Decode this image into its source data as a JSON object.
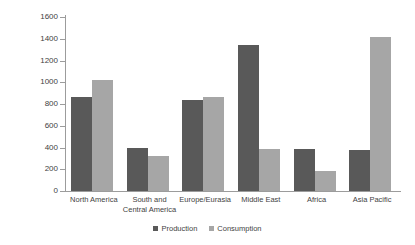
{
  "chart_data": {
    "type": "bar",
    "title": "",
    "xlabel": "",
    "ylabel": "",
    "ylim": [
      0,
      1600
    ],
    "ytick_step": 200,
    "grid": false,
    "legend_position": "bottom-center",
    "categories": [
      "North America",
      "South and Central America",
      "Europe/Eurasia",
      "Middle East",
      "Africa",
      "Asia Pacific"
    ],
    "category_lines": [
      [
        "North America"
      ],
      [
        "South and",
        "Central America"
      ],
      [
        "Europe/Eurasia"
      ],
      [
        "Middle East"
      ],
      [
        "Africa"
      ],
      [
        "Asia Pacific"
      ]
    ],
    "ytick_labels": [
      "1600",
      "1400",
      "1200",
      "1000",
      "800",
      "600",
      "400",
      "200",
      "0"
    ],
    "ytick_values": [
      1600,
      1400,
      1200,
      1000,
      800,
      600,
      400,
      200,
      0
    ],
    "series": [
      {
        "name": "Production",
        "color": "#595959",
        "values": [
          865,
          395,
          840,
          1340,
          385,
          380
        ]
      },
      {
        "name": "Consumption",
        "color": "#a6a6a6",
        "values": [
          1020,
          320,
          865,
          390,
          180,
          1420
        ]
      }
    ]
  },
  "legend": {
    "items": [
      {
        "label": "Production",
        "color": "#595959"
      },
      {
        "label": "Consumption",
        "color": "#a6a6a6"
      }
    ]
  },
  "axis": {
    "line_color": "#9c9c9c"
  }
}
